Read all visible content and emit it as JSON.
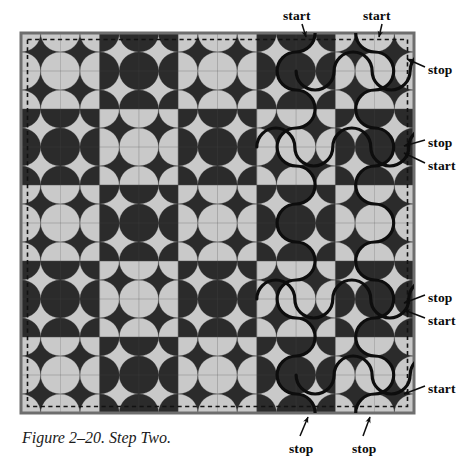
{
  "figure": {
    "caption": "Figure 2–20. Step Two.",
    "title": "Step Two",
    "number": "2–20"
  },
  "colors": {
    "light": "#c9c9c9",
    "dark": "#2b2b2b",
    "line": "#111111",
    "background": "#ffffff",
    "border": "#6e6e6e",
    "dashed": "#111111"
  },
  "grid": {
    "blocks_across": 5,
    "blocks_down": 5,
    "cells_per_block": 2,
    "block_size_px": 78.6,
    "origin_x": 21,
    "origin_y": 33
  },
  "labels": [
    {
      "id": "start-top-1",
      "text": "start",
      "x": 283,
      "y": 8,
      "anchor": "left"
    },
    {
      "id": "start-top-2",
      "text": "start",
      "x": 363,
      "y": 8,
      "anchor": "left"
    },
    {
      "id": "stop-right-1",
      "text": "stop",
      "x": 428,
      "y": 62,
      "anchor": "left"
    },
    {
      "id": "stop-right-2",
      "text": "stop",
      "x": 428,
      "y": 135,
      "anchor": "left"
    },
    {
      "id": "start-right-1",
      "text": "start",
      "x": 428,
      "y": 158,
      "anchor": "left"
    },
    {
      "id": "stop-right-3",
      "text": "stop",
      "x": 428,
      "y": 290,
      "anchor": "left"
    },
    {
      "id": "start-right-2",
      "text": "start",
      "x": 428,
      "y": 313,
      "anchor": "left"
    },
    {
      "id": "start-right-3",
      "text": "start",
      "x": 428,
      "y": 381,
      "anchor": "left"
    },
    {
      "id": "stop-bottom-1",
      "text": "stop",
      "x": 289,
      "y": 441,
      "anchor": "left"
    },
    {
      "id": "stop-bottom-2",
      "text": "stop",
      "x": 352,
      "y": 441,
      "anchor": "left"
    }
  ],
  "leaders": [
    {
      "id": "leader-start-top-1",
      "from": [
        302,
        24
      ],
      "to": [
        306,
        37
      ]
    },
    {
      "id": "leader-start-top-2",
      "from": [
        382,
        24
      ],
      "to": [
        379,
        37
      ]
    },
    {
      "id": "leader-stop-right-1",
      "from": [
        425,
        67
      ],
      "to": [
        407,
        59
      ]
    },
    {
      "id": "leader-stop-right-2",
      "from": [
        425,
        140
      ],
      "to": [
        404,
        146
      ]
    },
    {
      "id": "leader-start-right-1",
      "from": [
        425,
        163
      ],
      "to": [
        404,
        153
      ]
    },
    {
      "id": "leader-stop-right-3",
      "from": [
        425,
        295
      ],
      "to": [
        404,
        303
      ]
    },
    {
      "id": "leader-start-right-2",
      "from": [
        425,
        318
      ],
      "to": [
        404,
        310
      ]
    },
    {
      "id": "leader-start-right-3",
      "from": [
        425,
        386
      ],
      "to": [
        404,
        394
      ]
    },
    {
      "id": "leader-stop-bottom-1",
      "from": [
        300,
        436
      ],
      "to": [
        308,
        417
      ]
    },
    {
      "id": "leader-stop-bottom-2",
      "from": [
        363,
        436
      ],
      "to": [
        370,
        417
      ]
    }
  ],
  "quilting_paths": {
    "description": "serpentine arc chains traced over the pattern",
    "stroke_color": "#0d0d0d",
    "stroke_width": 3.2
  }
}
